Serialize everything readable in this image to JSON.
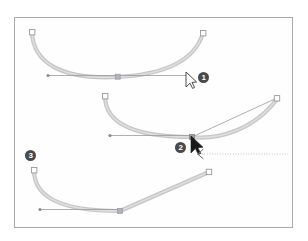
{
  "figure": {
    "frame": {
      "border_color": "#a8a8ab",
      "background": "#fefefe"
    },
    "colors": {
      "stroke_gray": "#c3c3c6",
      "stroke_gray_dark": "#a9a9ad",
      "anchor_fill": "#ffffff",
      "anchor_border": "#9a9a9e",
      "selected_anchor": "#b0b0b4",
      "handle_line": "#8d8d91",
      "badge_bg": "#4a4a4d",
      "badge_text": "#ffffff",
      "cursor_fill": "#1a1a1a",
      "dotted_guide": "#b5b5b9"
    }
  },
  "steps": [
    {
      "number": "1",
      "label": "Step 1",
      "description": "Smooth curve with a selected anchor point and a horizontal direction handle; hollow arrow cursor at right.",
      "cursor": "hollow-arrow",
      "path_type": "smooth-curve"
    },
    {
      "number": "2",
      "label": "Step 2",
      "description": "Dragging the direction handle to the upper right converts the segment, pulling a new curve toward the right anchor.",
      "cursor": "solid-arrow",
      "path_type": "dragged-curve",
      "drag_guide": "dotted-arrow-left"
    },
    {
      "number": "3",
      "label": "Step 3",
      "description": "Resulting path: curve on the left joined to a straight segment at a corner point.",
      "cursor": "none",
      "path_type": "curve-plus-line"
    }
  ],
  "annotations": {
    "badge_1": "1",
    "badge_2": "2",
    "badge_3": "3"
  }
}
